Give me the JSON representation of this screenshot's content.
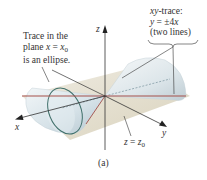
{
  "figure": {
    "caption": "(a)",
    "axes": {
      "x_label": "x",
      "y_label": "y",
      "z_label": "z"
    },
    "annotations": {
      "ellipse_trace": {
        "line1": "Trace in the",
        "line2_prefix": "plane ",
        "line2_var": "x",
        "line2_eq": " = ",
        "line2_rhs_var": "x",
        "line2_rhs_sub": "0",
        "line3": "is an ellipse."
      },
      "xy_trace": {
        "line1_var": "xy",
        "line1_text": "-trace:",
        "line2_var": "y",
        "line2_eq": " = ±4",
        "line2_rhs_var": "x",
        "line3": "(two lines)"
      },
      "plane_label": {
        "var": "z",
        "eq": " = ",
        "rhs_var": "z",
        "rhs_sub": "0"
      }
    },
    "colors": {
      "plane": "#d9d2bd",
      "cone_surface": "#dfe8ec",
      "cone_shadow": "#b9c9d1",
      "ellipse": "#3f6f6a",
      "xy_line": "#a5504a",
      "axes": "#333333",
      "leader": "#333333"
    }
  }
}
